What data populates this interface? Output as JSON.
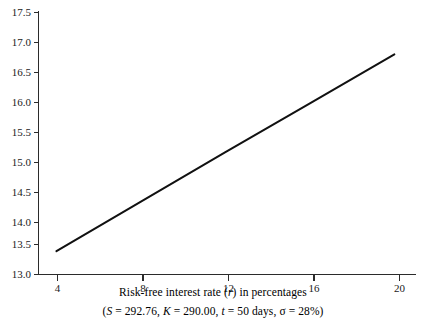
{
  "chart_data": {
    "type": "line",
    "title": "",
    "subtitle": "",
    "xlabel": "Risk-free interest rate (r) in percentages",
    "ylabel": "",
    "caption": "(S = 292.76, K = 290.00, t = 50 days, σ = 28%)",
    "xlim": [
      3.15,
      21.0
    ],
    "ylim": [
      13.0,
      17.5
    ],
    "xticks": [
      4,
      8,
      12,
      16,
      20
    ],
    "xticklabels": [
      "4",
      "8",
      "12",
      "16",
      "20"
    ],
    "yticks": [
      13.0,
      13.5,
      14.0,
      14.5,
      15.0,
      15.5,
      16.0,
      16.5,
      17.0,
      17.5
    ],
    "yticklabels": [
      "13.0",
      "13.5",
      "14.0",
      "14.5",
      "15.0",
      "15.5",
      "16.0",
      "16.5",
      "17.0",
      "17.5"
    ],
    "grid": false,
    "legend": null,
    "series": [
      {
        "name": "option value vs risk-free rate",
        "x": [
          4,
          8,
          12,
          16,
          20
        ],
        "values": [
          13.4,
          14.25,
          15.1,
          15.94,
          16.78
        ],
        "color": "#111111"
      }
    ],
    "annotations": [],
    "parameters": {
      "S": "292.76",
      "K": "290.00",
      "t": "50 days",
      "sigma": "28%"
    }
  },
  "figure": {
    "xlabel_prefix": "Risk-free interest rate (",
    "xlabel_symbol": "r",
    "xlabel_suffix": ") in percentages",
    "caption_open": "(",
    "caption_s_sym": "S",
    "caption_s_val": " = 292.76, ",
    "caption_k_sym": "K",
    "caption_k_val": " = 290.00, ",
    "caption_t_sym": "t",
    "caption_t_val": " = 50 days, ",
    "caption_sigma_sym": "σ",
    "caption_sigma_val": " = 28%)"
  },
  "colors": {
    "background": "#ffffff",
    "axis": "#2b2b2b",
    "line": "#111111",
    "text": "#1a1a1a"
  }
}
